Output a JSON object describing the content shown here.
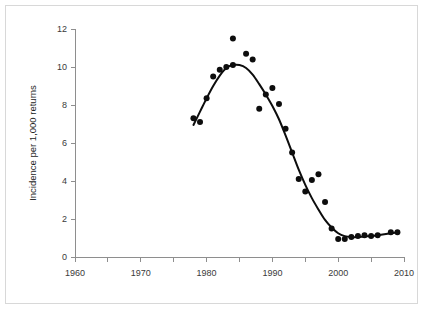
{
  "figure": {
    "border_color": "#d8d8d8",
    "background_color": "#ffffff"
  },
  "chart_data": {
    "type": "scatter",
    "title": "",
    "subtitle": "",
    "xlabel": "",
    "ylabel": "Incidence per 1,000 returns",
    "xlim": [
      1960,
      2010
    ],
    "ylim": [
      0,
      12
    ],
    "xticks": [
      1960,
      1970,
      1980,
      1990,
      2000,
      2010
    ],
    "xtick_labels": [
      "1960",
      "1970",
      "1980",
      "1990",
      "2000",
      "2010"
    ],
    "xminor_ticks": [
      1965,
      1975,
      1985,
      1995,
      2005
    ],
    "yticks": [
      0,
      2,
      4,
      6,
      8,
      10,
      12
    ],
    "ytick_labels": [
      "0",
      "2",
      "4",
      "6",
      "8",
      "10",
      "12"
    ],
    "grid": false,
    "legend": null,
    "legend_position": "none",
    "marker_color": "#0d0d0d",
    "marker_size": 3,
    "line_color": "#0d0d0d",
    "annotations": [],
    "series": [
      {
        "name": "Observed incidence",
        "type": "scatter",
        "x": [
          1978,
          1979,
          1980,
          1981,
          1982,
          1983,
          1984,
          1984,
          1986,
          1987,
          1988,
          1989,
          1990,
          1991,
          1992,
          1993,
          1994,
          1995,
          1996,
          1997,
          1998,
          1999,
          2000,
          2001,
          2002,
          2003,
          2004,
          2005,
          2006,
          2008,
          2009
        ],
        "y": [
          7.3,
          7.1,
          8.35,
          9.5,
          9.85,
          10.0,
          10.1,
          11.5,
          10.7,
          10.4,
          7.8,
          8.55,
          8.9,
          8.05,
          6.75,
          5.5,
          4.1,
          3.45,
          4.05,
          4.35,
          2.9,
          1.5,
          0.95,
          0.95,
          1.05,
          1.1,
          1.15,
          1.1,
          1.15,
          1.3,
          1.3
        ]
      },
      {
        "name": "Fitted trend",
        "type": "line",
        "x": [
          1978,
          1979,
          1980,
          1981,
          1982,
          1983,
          1984,
          1985,
          1986,
          1987,
          1988,
          1989,
          1990,
          1991,
          1992,
          1993,
          1994,
          1995,
          1996,
          1997,
          1998,
          1999,
          2000,
          2001,
          2002,
          2003,
          2004,
          2005,
          2006,
          2007,
          2008,
          2009
        ],
        "y": [
          6.95,
          7.65,
          8.35,
          9.0,
          9.55,
          9.95,
          10.1,
          10.1,
          9.95,
          9.6,
          9.1,
          8.55,
          7.95,
          7.25,
          6.4,
          5.5,
          4.6,
          3.8,
          3.1,
          2.5,
          1.95,
          1.55,
          1.25,
          1.1,
          1.05,
          1.05,
          1.08,
          1.1,
          1.15,
          1.2,
          1.25,
          1.3
        ]
      }
    ]
  }
}
